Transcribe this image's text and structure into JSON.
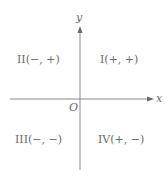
{
  "diagram": {
    "axes": {
      "x_label": "x",
      "y_label": "y",
      "origin_label": "O",
      "axis_color": "#8a8a8a",
      "text_color": "#6a6a6a"
    },
    "quadrants": [
      {
        "id": "I",
        "label": "I(+, +)"
      },
      {
        "id": "II",
        "label": "II(−, +)"
      },
      {
        "id": "III",
        "label": "III(−, −)"
      },
      {
        "id": "IV",
        "label": "IV(+, −)"
      }
    ]
  }
}
